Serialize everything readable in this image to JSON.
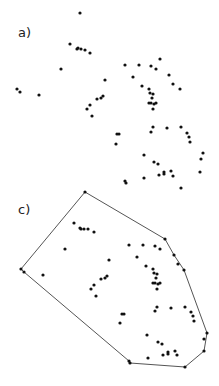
{
  "figure": {
    "type": "convex-hull-illustration",
    "panels": [
      {
        "label": "a)",
        "label_pos": [
          20,
          36
        ],
        "description": "point set",
        "points": [
          [
            80,
            13
          ],
          [
            70,
            44
          ],
          [
            77,
            49
          ],
          [
            78,
            48
          ],
          [
            81,
            49
          ],
          [
            85,
            50
          ],
          [
            90,
            53
          ],
          [
            61,
            69
          ],
          [
            17,
            89
          ],
          [
            20,
            92
          ],
          [
            39,
            95
          ],
          [
            105,
            80
          ],
          [
            125,
            65
          ],
          [
            139,
            65
          ],
          [
            151,
            66
          ],
          [
            156,
            69
          ],
          [
            160,
            59
          ],
          [
            133,
            77
          ],
          [
            169,
            75
          ],
          [
            173,
            84
          ],
          [
            180,
            89
          ],
          [
            142,
            86
          ],
          [
            149,
            89
          ],
          [
            150,
            93
          ],
          [
            153,
            94
          ],
          [
            152,
            98
          ],
          [
            151,
            103
          ],
          [
            149,
            103
          ],
          [
            154,
            104
          ],
          [
            156,
            103
          ],
          [
            153,
            109
          ],
          [
            103,
            96
          ],
          [
            101,
            98
          ],
          [
            97,
            99
          ],
          [
            90,
            105
          ],
          [
            87,
            109
          ],
          [
            92,
            116
          ],
          [
            117,
            134
          ],
          [
            119,
            134
          ],
          [
            116,
            144
          ],
          [
            153,
            127
          ],
          [
            151,
            132
          ],
          [
            167,
            128
          ],
          [
            181,
            127
          ],
          [
            187,
            133
          ],
          [
            189,
            137
          ],
          [
            190,
            142
          ],
          [
            144,
            155
          ],
          [
            154,
            162
          ],
          [
            158,
            164
          ],
          [
            203,
            153
          ],
          [
            201,
            159
          ],
          [
            200,
            172
          ],
          [
            159,
            175
          ],
          [
            164,
            172
          ],
          [
            164,
            174
          ],
          [
            171,
            171
          ],
          [
            173,
            176
          ],
          [
            144,
            178
          ],
          [
            125,
            181
          ],
          [
            126,
            183
          ],
          [
            181,
            188
          ],
          [
            85,
            192
          ]
        ]
      },
      {
        "label": "c)",
        "label_pos": [
          20,
          212
        ],
        "description": "point set with convex hull",
        "points": [
          [
            85,
            192
          ],
          [
            74,
            223
          ],
          [
            80,
            228
          ],
          [
            81,
            229
          ],
          [
            84,
            229
          ],
          [
            88,
            229
          ],
          [
            94,
            232
          ],
          [
            65,
            249
          ],
          [
            21,
            269
          ],
          [
            24,
            272
          ],
          [
            43,
            275
          ],
          [
            109,
            260
          ],
          [
            129,
            245
          ],
          [
            143,
            245
          ],
          [
            155,
            246
          ],
          [
            160,
            249
          ],
          [
            165,
            239
          ],
          [
            137,
            257
          ],
          [
            174,
            255
          ],
          [
            178,
            264
          ],
          [
            184,
            270
          ],
          [
            146,
            266
          ],
          [
            153,
            269
          ],
          [
            154,
            273
          ],
          [
            157,
            274
          ],
          [
            156,
            278
          ],
          [
            155,
            283
          ],
          [
            153,
            283
          ],
          [
            158,
            284
          ],
          [
            160,
            283
          ],
          [
            157,
            289
          ],
          [
            107,
            276
          ],
          [
            105,
            278
          ],
          [
            101,
            279
          ],
          [
            94,
            285
          ],
          [
            91,
            289
          ],
          [
            96,
            296
          ],
          [
            122,
            314
          ],
          [
            124,
            314
          ],
          [
            120,
            323
          ],
          [
            157,
            307
          ],
          [
            155,
            311
          ],
          [
            171,
            308
          ],
          [
            185,
            307
          ],
          [
            191,
            312
          ],
          [
            193,
            316
          ],
          [
            194,
            321
          ],
          [
            147,
            335
          ],
          [
            158,
            342
          ],
          [
            162,
            344
          ],
          [
            207,
            333
          ],
          [
            204,
            339
          ],
          [
            204,
            351
          ],
          [
            163,
            355
          ],
          [
            168,
            352
          ],
          [
            168,
            354
          ],
          [
            175,
            351
          ],
          [
            177,
            355
          ],
          [
            148,
            358
          ],
          [
            129,
            361
          ],
          [
            130,
            363
          ],
          [
            185,
            367
          ]
        ],
        "hull": [
          [
            85,
            192
          ],
          [
            165,
            239
          ],
          [
            174,
            255
          ],
          [
            184,
            270
          ],
          [
            207,
            333
          ],
          [
            204,
            339
          ],
          [
            204,
            351
          ],
          [
            185,
            367
          ],
          [
            130,
            363
          ],
          [
            129,
            361
          ],
          [
            21,
            269
          ],
          [
            24,
            272
          ]
        ]
      }
    ],
    "colors": {
      "point": "#111111",
      "hull_line": "#555555",
      "background": "#ffffff"
    }
  }
}
